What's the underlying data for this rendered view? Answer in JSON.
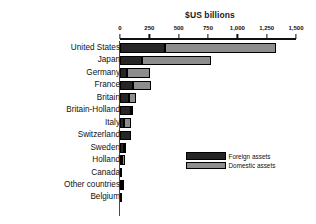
{
  "chart_data": {
    "type": "bar",
    "orientation": "horizontal",
    "stacked": true,
    "title": "",
    "xlabel": "$US billions",
    "ylabel": "",
    "xlim": [
      0,
      1500
    ],
    "xticks": [
      0,
      250,
      500,
      750,
      1000,
      1250,
      1500
    ],
    "xticklabels": [
      "0",
      "250",
      "500",
      "750",
      "1,000",
      "1,250",
      "1,500"
    ],
    "grid": false,
    "legend_position": "center-right",
    "categories": [
      "United States",
      "Japan",
      "Germany",
      "France",
      "Britain",
      "Britain-Holland",
      "Italy",
      "Switzerland",
      "Sweden",
      "Holland",
      "Canada",
      "Other countries",
      "Belgium"
    ],
    "series": [
      {
        "name": "Foreign assets",
        "color": "#262626",
        "values": [
          385,
          190,
          60,
          110,
          80,
          95,
          35,
          95,
          35,
          20,
          18,
          12,
          18
        ]
      },
      {
        "name": "Domestic assets",
        "color": "#8d8d8d",
        "values": [
          945,
          585,
          195,
          150,
          55,
          20,
          55,
          0,
          5,
          5,
          0,
          2,
          0
        ]
      }
    ],
    "totals": [
      1330,
      775,
      255,
      260,
      135,
      115,
      90,
      95,
      40,
      25,
      18,
      14,
      18
    ]
  },
  "axis": {
    "title": "$US billions"
  },
  "legend": {
    "items": [
      {
        "label": "Foreign assets",
        "color": "#262626"
      },
      {
        "label": "Domestic assets",
        "color": "#8d8d8d"
      }
    ]
  }
}
